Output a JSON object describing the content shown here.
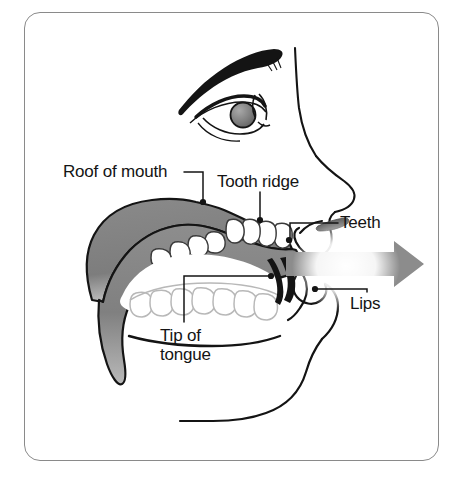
{
  "figure": {
    "frame": {
      "shape": "rounded-rectangle",
      "border_color": "#8a8a8a"
    },
    "colors": {
      "ink": "#141414",
      "tongue_gray": "#808080",
      "tongue_gray_light": "#9a9a9a",
      "tongue_gray_dark": "#6d6d6d",
      "arrow_gray": "#8c8c8c",
      "iris_gray": "#808080",
      "nostril_gray": "#6b6b6b",
      "teeth_fill": "#ffffff",
      "lower_teeth_outline": "#b8b8b8",
      "background": "#ffffff"
    },
    "labels": [
      {
        "id": "roof-of-mouth",
        "text": "Roof of mouth",
        "leader": "horizontal line right from text, then down to dot on palate",
        "dot": {
          "x": 203,
          "y": 202
        }
      },
      {
        "id": "tooth-ridge",
        "text": "Tooth ridge",
        "leader": "vertical line down from text to dot on alveolar ridge",
        "dot": {
          "x": 260,
          "y": 220
        }
      },
      {
        "id": "teeth",
        "text": "Teeth",
        "leader": "horizontal line left from text to dot on upper front tooth",
        "dot": {
          "x": 288,
          "y": 240
        }
      },
      {
        "id": "tip-of-tongue",
        "text": "Tip of\ntongue",
        "leader": "vertical line up from text then horizontal right to dot at tongue tip",
        "dot": {
          "x": 271,
          "y": 276
        }
      },
      {
        "id": "lips",
        "text": "Lips",
        "leader": "vertical line up from text then horizontal left to dot on lips",
        "dot": {
          "x": 315,
          "y": 289
        }
      }
    ],
    "airflow_arrow": {
      "description": "thick gray arrow pointing right out of the mouth, fading to white at the lips",
      "direction": "right",
      "meaning": "airstream leaving the mouth"
    },
    "features": [
      "eyebrow",
      "eye",
      "iris",
      "nose",
      "nostril",
      "upper lip",
      "lower lip",
      "chin",
      "jaw",
      "upper teeth",
      "lower teeth",
      "hard palate",
      "tongue"
    ]
  }
}
